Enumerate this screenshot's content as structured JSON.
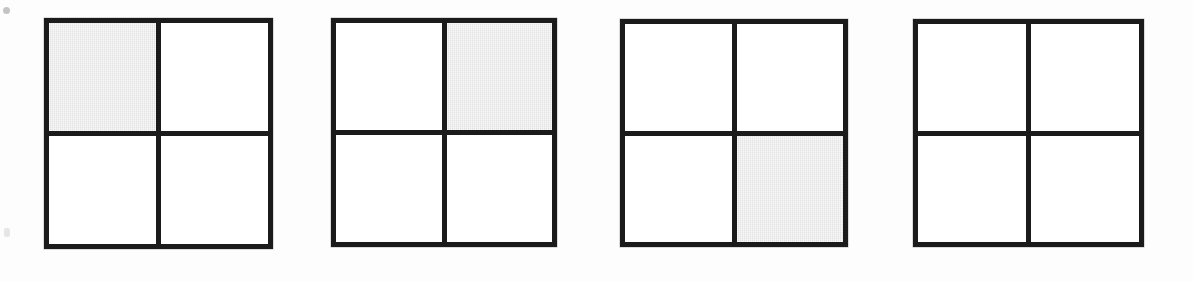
{
  "figure": {
    "background_color": "#fdfdfd",
    "line_color": "#1b1b1b",
    "shade_color": "#e3e3e3",
    "cell_fill_color": "#ffffff",
    "border_width_px": 5,
    "grid_count": 4,
    "rows": 2,
    "columns": 2
  },
  "artifacts": [
    {
      "name": "scan-speck-top",
      "label": ""
    },
    {
      "name": "scan-speck-bottom",
      "label": ""
    }
  ],
  "grids": [
    {
      "id": "grid-1",
      "label": "",
      "shaded_cells": [
        "top-left"
      ],
      "cells": [
        {
          "position": "top-left",
          "shaded": true,
          "label": ""
        },
        {
          "position": "top-right",
          "shaded": false,
          "label": ""
        },
        {
          "position": "bottom-left",
          "shaded": false,
          "label": ""
        },
        {
          "position": "bottom-right",
          "shaded": false,
          "label": ""
        }
      ]
    },
    {
      "id": "grid-2",
      "label": "",
      "shaded_cells": [
        "top-right"
      ],
      "cells": [
        {
          "position": "top-left",
          "shaded": false,
          "label": ""
        },
        {
          "position": "top-right",
          "shaded": true,
          "label": ""
        },
        {
          "position": "bottom-left",
          "shaded": false,
          "label": ""
        },
        {
          "position": "bottom-right",
          "shaded": false,
          "label": ""
        }
      ]
    },
    {
      "id": "grid-3",
      "label": "",
      "shaded_cells": [
        "bottom-right"
      ],
      "cells": [
        {
          "position": "top-left",
          "shaded": false,
          "label": ""
        },
        {
          "position": "top-right",
          "shaded": false,
          "label": ""
        },
        {
          "position": "bottom-left",
          "shaded": false,
          "label": ""
        },
        {
          "position": "bottom-right",
          "shaded": true,
          "label": ""
        }
      ]
    },
    {
      "id": "grid-4",
      "label": "",
      "shaded_cells": [],
      "cells": [
        {
          "position": "top-left",
          "shaded": false,
          "label": ""
        },
        {
          "position": "top-right",
          "shaded": false,
          "label": ""
        },
        {
          "position": "bottom-left",
          "shaded": false,
          "label": ""
        },
        {
          "position": "bottom-right",
          "shaded": false,
          "label": ""
        }
      ]
    }
  ]
}
